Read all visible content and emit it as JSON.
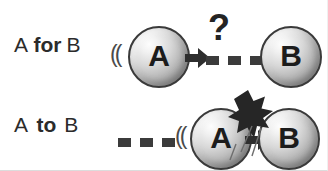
{
  "figure": {
    "background_color": "#ffffff",
    "ink_color": "#2b2b2b"
  },
  "colors": {
    "text": "#2b2b2b",
    "sphere_highlight": "#fdfdfd",
    "sphere_shadow": "#848484",
    "sphere_outline": "#3a3a3a",
    "dash": "#3b3b3b",
    "arrow": "#2e2e2e",
    "burst": "#262626"
  },
  "rows": [
    {
      "id": "for",
      "caption": {
        "lead": "A",
        "preposition": "for",
        "trail": "B"
      },
      "source_label": "A",
      "target_label": "B",
      "motion_marks": "((",
      "arrow_icon": "arrow-right-icon",
      "dash_count": 3,
      "annotation": "?",
      "annotation_icon": "question-mark-icon",
      "outcome": "does-not-reach"
    },
    {
      "id": "to",
      "caption": {
        "lead": "A",
        "preposition": "to",
        "trail": "B"
      },
      "source_label": "A",
      "target_label": "B",
      "motion_marks": "((",
      "arrow_icon": "arrow-right-icon",
      "dash_count": 3,
      "annotation": "",
      "annotation_icon": "impact-star-icon",
      "outcome": "contact"
    }
  ]
}
